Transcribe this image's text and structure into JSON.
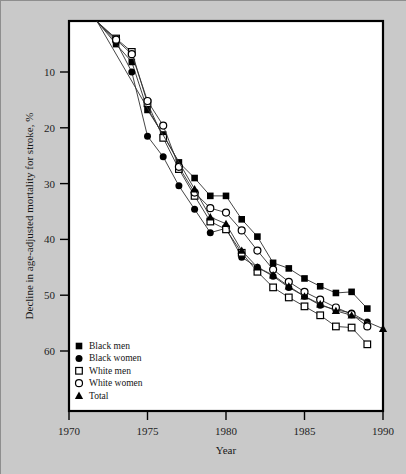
{
  "figure": {
    "background_color": "#c9c9c9",
    "plot_background_color": "#ffffff",
    "frame_color": "#000000"
  },
  "chart_data": {
    "type": "line",
    "title": "",
    "xlabel": "Year",
    "ylabel": "Decline in age-adjusted mortality for stroke, %",
    "xlim": [
      1970,
      1990
    ],
    "ylim": [
      0,
      64
    ],
    "y_inverted": true,
    "grid": false,
    "legend_position": "bottom-left",
    "xticks": [
      1970,
      1975,
      1980,
      1985,
      1990
    ],
    "xtick_labels": [
      "1970",
      "1975",
      "1980",
      "1985",
      "1990"
    ],
    "yticks": [
      10,
      20,
      30,
      40,
      50,
      60
    ],
    "ytick_labels": [
      "10",
      "20",
      "30",
      "40",
      "50",
      "60"
    ],
    "series": [
      {
        "name": "Black men",
        "marker": "filled-square",
        "color": "#000000",
        "x": [
          1971.8,
          1973,
          1974,
          1975,
          1976,
          1977,
          1978,
          1979,
          1980,
          1981,
          1982,
          1983,
          1984,
          1985,
          1986,
          1987,
          1988,
          1989
        ],
        "y": [
          1.0,
          5.0,
          8.2,
          16.8,
          21.2,
          26.2,
          29.0,
          32.2,
          32.2,
          36.4,
          39.5,
          44.2,
          45.2,
          47.0,
          48.4,
          49.6,
          49.4,
          52.4
        ]
      },
      {
        "name": "Black women",
        "marker": "filled-circle",
        "color": "#000000",
        "x": [
          1971.8,
          1973,
          1974,
          1975,
          1976,
          1977,
          1978,
          1979,
          1980,
          1981,
          1982,
          1983,
          1984,
          1985,
          1986,
          1987,
          1988,
          1989
        ],
        "y": [
          1.0,
          4.6,
          10.0,
          21.5,
          25.2,
          30.4,
          34.6,
          38.8,
          38.0,
          43.2,
          45.0,
          46.6,
          48.6,
          50.2,
          51.8,
          52.6,
          53.2,
          54.8
        ]
      },
      {
        "name": "White men",
        "marker": "open-square",
        "color": "#000000",
        "x": [
          1971.8,
          1973,
          1974,
          1975,
          1976,
          1977,
          1978,
          1979,
          1980,
          1981,
          1982,
          1983,
          1984,
          1985,
          1986,
          1987,
          1988,
          1989
        ],
        "y": [
          1.0,
          4.0,
          6.4,
          15.6,
          21.8,
          27.4,
          32.2,
          36.8,
          38.2,
          42.4,
          45.8,
          48.6,
          50.4,
          52.0,
          53.6,
          55.6,
          55.8,
          58.8
        ]
      },
      {
        "name": "White women",
        "marker": "open-circle",
        "color": "#000000",
        "x": [
          1971.8,
          1973,
          1974,
          1975,
          1976,
          1977,
          1978,
          1979,
          1980,
          1981,
          1982,
          1983,
          1984,
          1985,
          1986,
          1987,
          1988,
          1989
        ],
        "y": [
          1.0,
          4.2,
          6.8,
          15.2,
          19.6,
          27.0,
          31.6,
          34.4,
          35.2,
          38.4,
          42.0,
          45.4,
          47.6,
          49.4,
          50.8,
          52.2,
          53.4,
          55.6
        ]
      },
      {
        "name": "Total",
        "marker": "filled-triangle",
        "color": "#000000",
        "x": [
          1971.8,
          1978,
          1979,
          1980,
          1981,
          1982,
          1983,
          1984,
          1985,
          1986,
          1987,
          1988,
          1990
        ],
        "y": [
          1.0,
          31.0,
          36.0,
          37.2,
          42.0,
          45.0,
          46.4,
          48.4,
          50.2,
          51.6,
          52.8,
          53.6,
          56.0
        ]
      }
    ]
  },
  "legend": {
    "items": [
      {
        "label": "Black men",
        "marker": "filled-square"
      },
      {
        "label": "Black women",
        "marker": "filled-circle"
      },
      {
        "label": "White men",
        "marker": "open-square"
      },
      {
        "label": "White women",
        "marker": "open-circle"
      },
      {
        "label": "Total",
        "marker": "filled-triangle"
      }
    ]
  }
}
